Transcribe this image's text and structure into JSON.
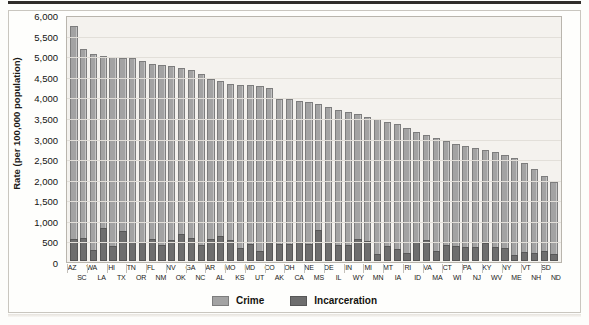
{
  "figure": {
    "y_axis_title": "Rate (per 100,000 population)"
  },
  "legend": {
    "items": [
      {
        "label": "Crime",
        "color": "#a3a3a3",
        "name": "crime"
      },
      {
        "label": "Incarceration",
        "color": "#6e6e6e",
        "name": "incarceration"
      }
    ]
  },
  "chart_data": {
    "type": "bar",
    "subtype": "stacked-bar",
    "title": "",
    "xlabel": "",
    "ylabel": "Rate (per 100,000 population)",
    "ylim": [
      0,
      6000
    ],
    "ytick_step": 500,
    "ytick_labels": [
      "6,000",
      "5,500",
      "5,000",
      "4,500",
      "4,000",
      "3,500",
      "3,000",
      "2,500",
      "2,000",
      "1,500",
      "1,000",
      "500",
      "0"
    ],
    "ytick_values": [
      6000,
      5500,
      5000,
      4500,
      4000,
      3500,
      3000,
      2500,
      2000,
      1500,
      1000,
      500,
      0
    ],
    "grid": true,
    "legend_position": "bottom-center",
    "label_layout": "alternating-two-rows",
    "categories": [
      "AZ",
      "SC",
      "WA",
      "LA",
      "HI",
      "TX",
      "TN",
      "OR",
      "FL",
      "NM",
      "NV",
      "OK",
      "GA",
      "NC",
      "AR",
      "AL",
      "MO",
      "KS",
      "MD",
      "UT",
      "CO",
      "AK",
      "OH",
      "CA",
      "NE",
      "MS",
      "DE",
      "IL",
      "IN",
      "WY",
      "MI",
      "MN",
      "MT",
      "IA",
      "RI",
      "ID",
      "VA",
      "MA",
      "CT",
      "WI",
      "PA",
      "NJ",
      "KY",
      "WV",
      "NY",
      "ME",
      "VT",
      "NH",
      "SD",
      "ND"
    ],
    "series": [
      {
        "name": "Crime",
        "color": "#a3a3a3",
        "values": [
          5800,
          5240,
          5120,
          5060,
          5040,
          5020,
          5010,
          4940,
          4870,
          4850,
          4820,
          4760,
          4710,
          4610,
          4500,
          4440,
          4370,
          4350,
          4340,
          4320,
          4280,
          4010,
          4000,
          3960,
          3920,
          3870,
          3800,
          3740,
          3690,
          3620,
          3560,
          3500,
          3440,
          3380,
          3290,
          3190,
          3110,
          3030,
          2960,
          2900,
          2830,
          2790,
          2740,
          2700,
          2620,
          2540,
          2430,
          2280,
          2100,
          1950
        ]
      },
      {
        "name": "Incarceration",
        "color": "#6e6e6e",
        "values": [
          560,
          580,
          280,
          820,
          380,
          740,
          480,
          470,
          550,
          400,
          530,
          680,
          570,
          390,
          550,
          620,
          530,
          330,
          430,
          250,
          470,
          420,
          430,
          470,
          420,
          770,
          470,
          400,
          400,
          560,
          490,
          180,
          380,
          290,
          200,
          480,
          530,
          250,
          400,
          380,
          350,
          350,
          450,
          360,
          340,
          150,
          230,
          190,
          260,
          180
        ]
      }
    ]
  }
}
